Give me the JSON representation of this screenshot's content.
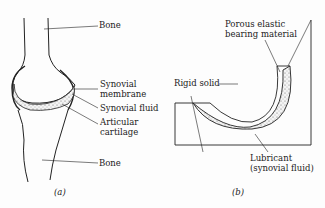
{
  "panel_a": {
    "caption": "(a)",
    "labels": {
      "bone_top": "Bone",
      "synovial_membrane_1": "Synovial",
      "synovial_membrane_2": "membrane",
      "synovial_fluid": "Synovial fluid",
      "articular_cartilage_1": "Articular",
      "articular_cartilage_2": "cartilage",
      "bone_bottom": "Bone"
    }
  },
  "panel_b": {
    "caption": "(b)",
    "labels": {
      "porous_1": "Porous elastic",
      "porous_2": "bearing material",
      "rigid_solid": "Rigid solid",
      "lubricant_1": "Lubricant",
      "lubricant_2": "(synovial fluid)"
    }
  }
}
